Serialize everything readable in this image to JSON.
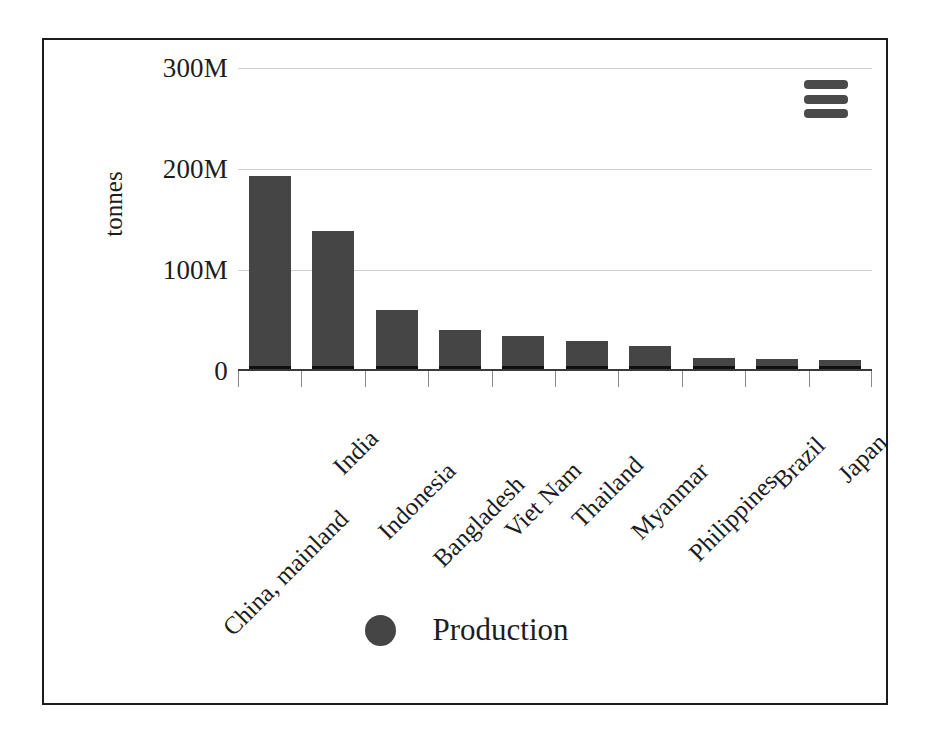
{
  "chart_data": {
    "type": "bar",
    "title": "",
    "subtitle": "",
    "xlabel": "",
    "ylabel": "tonnes",
    "ylim": [
      0,
      300000000
    ],
    "grid": true,
    "legend_position": "bottom",
    "y_ticks": [
      {
        "value": 0,
        "label": "0"
      },
      {
        "value": 100000000,
        "label": "100M"
      },
      {
        "value": 200000000,
        "label": "200M"
      },
      {
        "value": 300000000,
        "label": "300M"
      }
    ],
    "categories": [
      "China, mainland",
      "India",
      "Indonesia",
      "Bangladesh",
      "Viet Nam",
      "Thailand",
      "Myanmar",
      "Philippines",
      "Brazil",
      "Japan"
    ],
    "series": [
      {
        "name": "Production",
        "color": "#454545",
        "values": [
          193000000,
          139000000,
          60000000,
          41000000,
          35000000,
          30000000,
          25000000,
          12500000,
          11500000,
          11000000
        ]
      }
    ],
    "legend": [
      {
        "label": "Production",
        "marker": "circle",
        "color": "#454545"
      }
    ]
  },
  "toolbar": {
    "menu_label": "Menu"
  },
  "colors": {
    "bar_fill": "#454545",
    "bar_foot": "#101010",
    "gridline": "#d0d0d4",
    "axis": "#3a3a3a",
    "text": "#1d1d1d",
    "frame_border": "#1c1c1c",
    "menu_icon": "#4a4a4a"
  }
}
